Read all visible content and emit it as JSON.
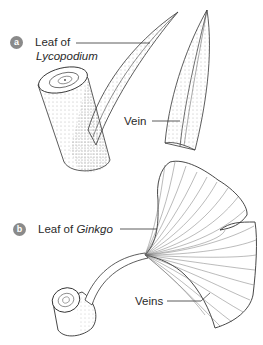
{
  "figure": {
    "panel_a": {
      "badge": "a",
      "title_prefix": "Leaf of",
      "title_genus": "Lycopodium",
      "callouts": [
        {
          "label": "Vein"
        }
      ]
    },
    "panel_b": {
      "badge": "b",
      "title_prefix": "Leaf of",
      "title_genus": "Ginkgo",
      "callouts": [
        {
          "label": "Veins"
        }
      ]
    },
    "colors": {
      "badge": "#8a8a8a",
      "ink": "#2a2a2a",
      "background": "#ffffff"
    }
  }
}
